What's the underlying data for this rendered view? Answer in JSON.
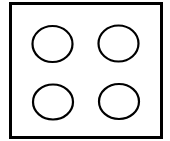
{
  "diagram": {
    "background": "#ffffff",
    "stroke_color": "#000000",
    "frame": {
      "shape": "rectangle",
      "x": 10.5,
      "y": 3.5,
      "width": 151,
      "height": 134,
      "stroke_width": 3
    },
    "circles": [
      {
        "name": "circle-top-left",
        "cx": 52.5,
        "cy": 44,
        "rx": 20,
        "ry": 18,
        "stroke_width": 2.2
      },
      {
        "name": "circle-top-right",
        "cx": 118.5,
        "cy": 43.5,
        "rx": 20,
        "ry": 18,
        "stroke_width": 2.2
      },
      {
        "name": "circle-bottom-left",
        "cx": 53,
        "cy": 102,
        "rx": 20,
        "ry": 17.5,
        "stroke_width": 2.2
      },
      {
        "name": "circle-bottom-right",
        "cx": 119,
        "cy": 101.5,
        "rx": 20,
        "ry": 17.5,
        "stroke_width": 2.2
      }
    ]
  }
}
